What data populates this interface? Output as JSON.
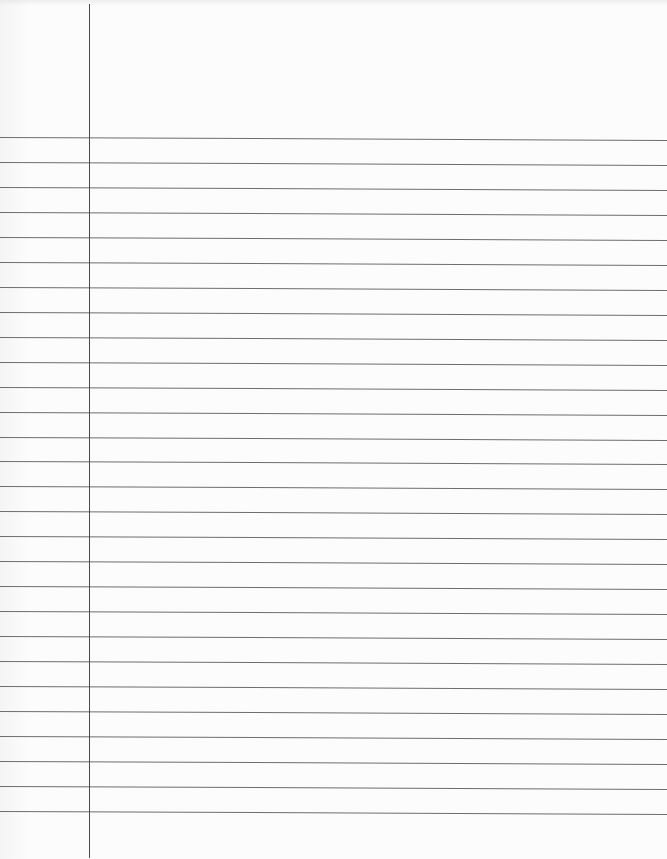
{
  "page": {
    "type": "lined-notebook-paper",
    "background_color": "#fcfcfc",
    "rule_color": "#6d6d6d",
    "margin_color": "#4a4a4a",
    "margin_x": 89,
    "first_rule_y": 137,
    "rule_spacing": 24.96,
    "rule_count": 28
  }
}
